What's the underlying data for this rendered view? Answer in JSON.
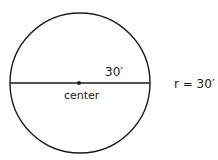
{
  "diagram": {
    "type": "circle-radius",
    "shape": "circle",
    "center": {
      "x": 80,
      "y": 83
    },
    "radius_px": 70,
    "stroke_color": "#1a1a1a",
    "labels": {
      "segment": "30′",
      "center": "center",
      "formula": "r = 30′"
    }
  }
}
